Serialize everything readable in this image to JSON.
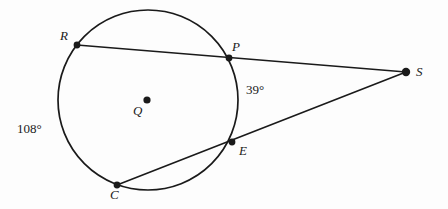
{
  "figure": {
    "type": "circle-secant-geometry-diagram",
    "background_color": "#fdfdfd",
    "stroke_color": "#1a1a1a",
    "width": 448,
    "height": 209
  },
  "circle": {
    "name": "circle-Q",
    "center": {
      "x": 148,
      "y": 100
    },
    "radius": 90,
    "stroke_width": 1.6
  },
  "points": [
    {
      "id": "R",
      "label": "R",
      "x": 77,
      "y": 45,
      "dot_radius": 3.4,
      "label_x": 60,
      "label_y": 29
    },
    {
      "id": "P",
      "label": "P",
      "x": 229,
      "y": 58,
      "dot_radius": 3.4,
      "label_x": 232,
      "label_y": 40
    },
    {
      "id": "S",
      "label": "S",
      "x": 406,
      "y": 72,
      "dot_radius": 4.2,
      "label_x": 416,
      "label_y": 65
    },
    {
      "id": "Q",
      "label": "Q",
      "x": 147,
      "y": 100,
      "dot_radius": 3.6,
      "label_x": 133,
      "label_y": 104
    },
    {
      "id": "E",
      "label": "E",
      "x": 232,
      "y": 142,
      "dot_radius": 3.4,
      "label_x": 239,
      "label_y": 144
    },
    {
      "id": "C",
      "label": "C",
      "x": 117,
      "y": 185,
      "dot_radius": 3.4,
      "label_x": 110,
      "label_y": 188
    }
  ],
  "segments": [
    {
      "name": "secant-R-to-S",
      "from": "R",
      "to": "S",
      "x1": 77,
      "y1": 45,
      "x2": 406,
      "y2": 72
    },
    {
      "name": "secant-C-to-S",
      "from": "C",
      "to": "S",
      "x1": 117,
      "y1": 185,
      "x2": 406,
      "y2": 72
    }
  ],
  "angle_labels": [
    {
      "name": "angle-measure-39",
      "text": "39°",
      "x": 246,
      "y": 83
    }
  ],
  "arc_labels": [
    {
      "name": "arc-measure-108",
      "text": "108°",
      "x": 17,
      "y": 122
    }
  ]
}
